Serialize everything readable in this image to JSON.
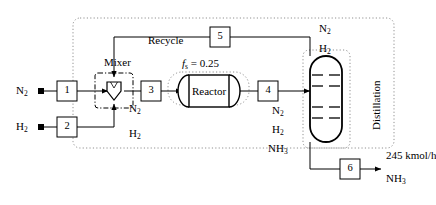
{
  "diagram": {
    "type": "process-flow-diagram",
    "units": {
      "mixer": "Mixer",
      "reactor": "Reactor",
      "distillation": "Distillation"
    },
    "reactor_parameter": {
      "symbol": "f",
      "subscript": "s",
      "equals": "= 0.25",
      "full": "fs = 0.25"
    },
    "recycle_label": "Recycle",
    "stream_numbers": [
      "1",
      "2",
      "3",
      "4",
      "5",
      "6"
    ],
    "feeds": [
      {
        "name": "nitrogen-feed",
        "label": "N",
        "sub": "2",
        "stream": "1"
      },
      {
        "name": "hydrogen-feed",
        "label": "H",
        "sub": "2",
        "stream": "2"
      }
    ],
    "stream3_components": [
      {
        "label": "N",
        "sub": "2"
      },
      {
        "label": "H",
        "sub": "2"
      }
    ],
    "stream4_components": [
      {
        "label": "N",
        "sub": "2"
      },
      {
        "label": "H",
        "sub": "2"
      },
      {
        "label": "NH",
        "sub": "3"
      }
    ],
    "overhead_components": [
      {
        "label": "N",
        "sub": "2"
      },
      {
        "label": "H",
        "sub": "2"
      }
    ],
    "product": {
      "flow": "245 kmol/h",
      "label": "NH",
      "sub": "3",
      "stream": "6"
    },
    "colors": {
      "line": "#000000",
      "boundary": "#808080",
      "background": "#ffffff"
    }
  }
}
